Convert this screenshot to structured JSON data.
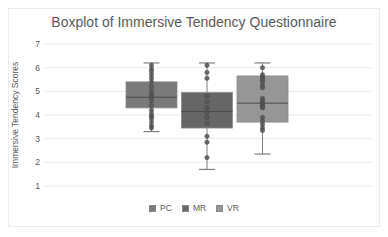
{
  "chart_data": {
    "type": "boxplot",
    "title": "Boxplot of Immersive Tendency Questionnaire",
    "xlabel": "",
    "ylabel": "Immersive Tendency Scores",
    "ylim": [
      1,
      7
    ],
    "yticks": [
      1,
      2,
      3,
      4,
      5,
      6,
      7
    ],
    "grid": true,
    "legend_position": "bottom",
    "series": [
      {
        "name": "PC",
        "color": "#7a7a7a",
        "min": 3.3,
        "q1": 4.3,
        "median": 4.75,
        "q3": 5.4,
        "max": 6.2,
        "points": [
          6.1,
          5.95,
          5.85,
          5.7,
          5.55,
          5.4,
          5.2,
          5.0,
          4.85,
          4.75,
          4.6,
          4.4,
          4.2,
          4.05,
          3.95,
          3.85,
          3.7,
          3.55,
          3.45
        ]
      },
      {
        "name": "MR",
        "color": "#666666",
        "min": 1.7,
        "q1": 3.45,
        "median": 4.15,
        "q3": 4.95,
        "max": 6.2,
        "points": [
          6.1,
          5.8,
          5.55,
          4.8,
          4.55,
          4.3,
          4.1,
          3.9,
          3.65,
          3.1,
          2.85,
          2.2
        ]
      },
      {
        "name": "VR",
        "color": "#969696",
        "min": 2.35,
        "q1": 3.7,
        "median": 4.5,
        "q3": 5.65,
        "max": 6.2,
        "points": [
          6.0,
          5.7,
          5.6,
          5.5,
          5.4,
          5.25,
          5.15,
          4.7,
          4.6,
          4.5,
          4.4,
          4.35,
          4.3,
          3.9,
          3.75,
          3.6,
          3.45,
          3.35
        ]
      }
    ]
  },
  "legend": {
    "items": [
      {
        "label": "PC",
        "color": "#7a7a7a"
      },
      {
        "label": "MR",
        "color": "#666666"
      },
      {
        "label": "VR",
        "color": "#969696"
      }
    ]
  },
  "colors": {
    "text": "#595959",
    "grid": "#e6e6e6",
    "whisker": "#7f7f7f",
    "point": "#555555"
  }
}
